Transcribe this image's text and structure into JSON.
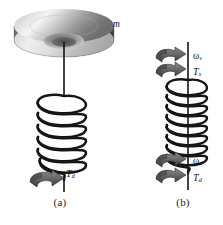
{
  "figure": {
    "background_color": "#ffffff",
    "ink_color": "#151515",
    "width": 223,
    "height": 225
  },
  "panels": [
    {
      "id": "a",
      "caption": "(a)",
      "description": "Disk of mass m suspended from a helical coil spring with applied torque at lower end",
      "elements": {
        "disk_label": "m",
        "torque_label": "T",
        "torque_subscript": "d"
      }
    },
    {
      "id": "b",
      "caption": "(b)",
      "description": "Free-body of the coil spring showing angular velocity and torque at both ends",
      "elements": {
        "top_omega_label": "ω",
        "top_omega_subscript": "s",
        "top_torque_label": "T",
        "top_torque_subscript": "s",
        "bottom_omega_label": "ω",
        "bottom_omega_subscript": "d",
        "bottom_torque_label": "T",
        "bottom_torque_subscript": "d"
      }
    }
  ],
  "labels": {
    "mass": "m",
    "torque_applied": "T",
    "torque_applied_sub": "d",
    "omega_shaft": "ω",
    "omega_shaft_sub": "s",
    "torque_shaft": "T",
    "torque_shaft_sub": "s",
    "omega_disk": "ω",
    "omega_disk_sub": "d",
    "torque_disk": "T",
    "torque_disk_sub": "d",
    "caption_a": "(a)",
    "caption_b": "(b)"
  },
  "colors": {
    "disk_top_light": "#f2f2f2",
    "disk_top_mid": "#b8b8b8",
    "disk_rim_dark": "#5a5a5a",
    "disk_hub": "#8f8f8f",
    "arrow_gray": "#707070",
    "arrow_dark": "#3d3d3d",
    "wire": "#151515"
  },
  "geometry": {
    "panel_a_coil_turns": 7,
    "panel_b_coil_turns": 9
  }
}
